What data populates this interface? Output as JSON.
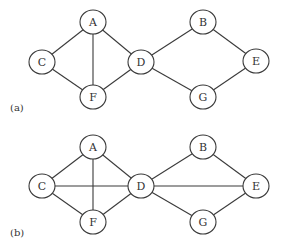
{
  "diagram": {
    "type": "graph",
    "style": {
      "stroke": "#3a3a3a",
      "node_fill": "#ffffff",
      "text": "#333333"
    },
    "node_size": {
      "rx": 13,
      "ry": 12
    },
    "panels": [
      {
        "label": "(a)",
        "label_pos": [
          10,
          111
        ],
        "nodes": [
          {
            "id": "A",
            "x": 93,
            "y": 22
          },
          {
            "id": "C",
            "x": 42,
            "y": 62
          },
          {
            "id": "F",
            "x": 93,
            "y": 97
          },
          {
            "id": "D",
            "x": 141,
            "y": 62
          },
          {
            "id": "B",
            "x": 203,
            "y": 22
          },
          {
            "id": "E",
            "x": 256,
            "y": 61
          },
          {
            "id": "G",
            "x": 203,
            "y": 97
          }
        ],
        "edges": [
          [
            "A",
            "C"
          ],
          [
            "A",
            "F"
          ],
          [
            "A",
            "D"
          ],
          [
            "C",
            "F"
          ],
          [
            "F",
            "D"
          ],
          [
            "D",
            "B"
          ],
          [
            "D",
            "G"
          ],
          [
            "B",
            "E"
          ],
          [
            "G",
            "E"
          ]
        ]
      },
      {
        "label": "(b)",
        "label_pos": [
          10,
          236
        ],
        "nodes": [
          {
            "id": "A",
            "x": 93,
            "y": 147
          },
          {
            "id": "C",
            "x": 42,
            "y": 186
          },
          {
            "id": "F",
            "x": 93,
            "y": 222
          },
          {
            "id": "D",
            "x": 141,
            "y": 186
          },
          {
            "id": "B",
            "x": 203,
            "y": 147
          },
          {
            "id": "E",
            "x": 256,
            "y": 186
          },
          {
            "id": "G",
            "x": 203,
            "y": 222
          }
        ],
        "edges": [
          [
            "A",
            "C"
          ],
          [
            "A",
            "F"
          ],
          [
            "A",
            "D"
          ],
          [
            "C",
            "F"
          ],
          [
            "F",
            "D"
          ],
          [
            "C",
            "D"
          ],
          [
            "D",
            "B"
          ],
          [
            "D",
            "G"
          ],
          [
            "B",
            "E"
          ],
          [
            "G",
            "E"
          ],
          [
            "D",
            "E"
          ]
        ]
      }
    ]
  }
}
